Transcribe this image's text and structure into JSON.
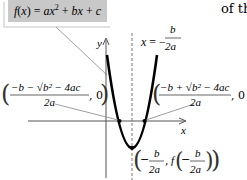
{
  "callout": {
    "function_label": "f(x) = ax² + bx + c",
    "fill": "#c8c8c8"
  },
  "side_text": "of th",
  "axes": {
    "x_label": "x",
    "y_label": "y"
  },
  "axis_of_symmetry": {
    "lhs": "x = −",
    "numerator": "b",
    "denominator": "2a"
  },
  "left_root": {
    "numerator": "−b − √b² − 4ac",
    "denominator": "2a",
    "y_coord": ", 0"
  },
  "right_root": {
    "numerator": "−b + √b² − 4ac",
    "denominator": "2a",
    "y_coord": ", 0"
  },
  "vertex": {
    "x_num": "b",
    "x_den": "2a",
    "fx_prefix": "f",
    "fx_num": "b",
    "fx_den": "2a"
  },
  "colors": {
    "curve": "#000000",
    "axes": "#555555",
    "dashed": "#777777",
    "leader": "#888888"
  }
}
